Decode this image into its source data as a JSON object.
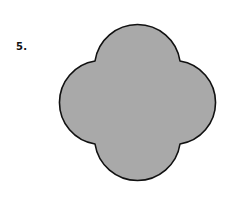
{
  "problem": {
    "number_label": "5."
  },
  "figure": {
    "shape": "quatrefoil",
    "fill_color": "#a9a9a9",
    "stroke_color": "#111111",
    "stroke_width": "1.6",
    "path": "M 95 61 A 43 43 0 0 1 180 61 A 42 42 0 0 1 180 144 A 43 43 0 0 1 95 144 A 42 42 0 0 1 95 61 Z"
  }
}
